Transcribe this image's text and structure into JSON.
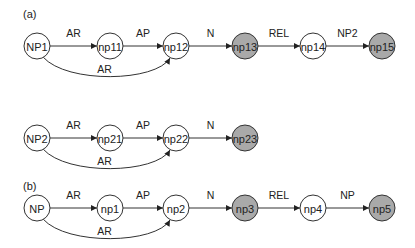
{
  "colors": {
    "shaded": "#a9a9a9",
    "plain": "#ffffff",
    "stroke": "#333333"
  },
  "panels": [
    {
      "label": "(a)",
      "rows": [
        {
          "nodes": [
            {
              "id": "NP1",
              "shaded": false
            },
            {
              "id": "np11",
              "shaded": false
            },
            {
              "id": "np12",
              "shaded": false
            },
            {
              "id": "np13",
              "shaded": true
            },
            {
              "id": "np14",
              "shaded": false
            },
            {
              "id": "np15",
              "shaded": true
            }
          ],
          "edges": [
            {
              "from": 0,
              "to": 1,
              "label": "AR"
            },
            {
              "from": 1,
              "to": 2,
              "label": "AP"
            },
            {
              "from": 2,
              "to": 3,
              "label": "N"
            },
            {
              "from": 3,
              "to": 4,
              "label": "REL"
            },
            {
              "from": 4,
              "to": 5,
              "label": "NP2"
            }
          ],
          "curved_edges": [
            {
              "from": 0,
              "to": 2,
              "label": "AR"
            }
          ]
        },
        {
          "nodes": [
            {
              "id": "NP2",
              "shaded": false
            },
            {
              "id": "np21",
              "shaded": false
            },
            {
              "id": "np22",
              "shaded": false
            },
            {
              "id": "np23",
              "shaded": true
            }
          ],
          "edges": [
            {
              "from": 0,
              "to": 1,
              "label": "AR"
            },
            {
              "from": 1,
              "to": 2,
              "label": "AP"
            },
            {
              "from": 2,
              "to": 3,
              "label": "N"
            }
          ],
          "curved_edges": [
            {
              "from": 0,
              "to": 2,
              "label": "AR"
            }
          ]
        }
      ]
    },
    {
      "label": "(b)",
      "rows": [
        {
          "nodes": [
            {
              "id": "NP",
              "shaded": false
            },
            {
              "id": "np1",
              "shaded": false
            },
            {
              "id": "np2",
              "shaded": false
            },
            {
              "id": "np3",
              "shaded": true
            },
            {
              "id": "np4",
              "shaded": false
            },
            {
              "id": "np5",
              "shaded": true
            }
          ],
          "edges": [
            {
              "from": 0,
              "to": 1,
              "label": "AR"
            },
            {
              "from": 1,
              "to": 2,
              "label": "AP"
            },
            {
              "from": 2,
              "to": 3,
              "label": "N"
            },
            {
              "from": 3,
              "to": 4,
              "label": "REL"
            },
            {
              "from": 4,
              "to": 5,
              "label": "NP"
            }
          ],
          "curved_edges": [
            {
              "from": 0,
              "to": 2,
              "label": "AR"
            }
          ]
        }
      ]
    }
  ]
}
